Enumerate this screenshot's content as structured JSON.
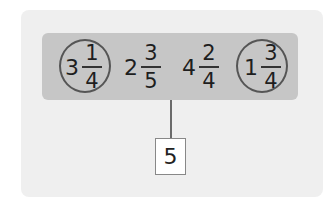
{
  "diagram": {
    "numbers": [
      {
        "whole": "3",
        "numerator": "1",
        "denominator": "4",
        "circled": true
      },
      {
        "whole": "2",
        "numerator": "3",
        "denominator": "5",
        "circled": false
      },
      {
        "whole": "4",
        "numerator": "2",
        "denominator": "4",
        "circled": false
      },
      {
        "whole": "1",
        "numerator": "3",
        "denominator": "4",
        "circled": true
      }
    ],
    "answer": "5",
    "colors": {
      "panel": "#efefef",
      "bar": "#c6c6c6",
      "circle": "#555555"
    }
  }
}
